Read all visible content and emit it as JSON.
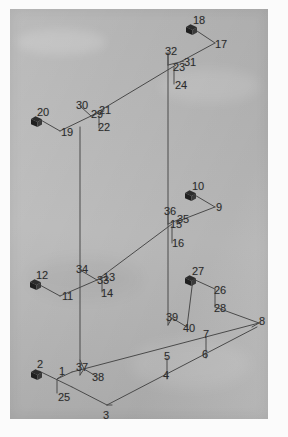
{
  "figure": {
    "type": "isometric-line-diagram",
    "panel": {
      "background_color": "#b8b8b8",
      "page_color": "#fbfbfb",
      "line_color": "#4a4a4a",
      "label_color": "#2b2b2b",
      "marker_color": "#2d2d2d",
      "x": 10,
      "y": 9,
      "width": 258,
      "height": 410
    }
  },
  "markers": [
    {
      "name": "node-marker-2",
      "label": "2",
      "x": 30,
      "y": 367,
      "label_x": 37,
      "label_y": 359
    },
    {
      "name": "node-marker-12",
      "label": "12",
      "x": 29,
      "y": 277,
      "label_x": 36,
      "label_y": 270
    },
    {
      "name": "node-marker-20",
      "label": "20",
      "x": 30,
      "y": 114,
      "label_x": 37,
      "label_y": 107
    },
    {
      "name": "node-marker-18",
      "label": "18",
      "x": 185,
      "y": 22,
      "label_x": 193,
      "label_y": 15
    },
    {
      "name": "node-marker-10",
      "label": "10",
      "x": 184,
      "y": 188,
      "label_x": 192,
      "label_y": 181
    },
    {
      "name": "node-marker-27",
      "label": "27",
      "x": 184,
      "y": 273,
      "label_x": 192,
      "label_y": 266
    }
  ],
  "labels": [
    {
      "id": "1",
      "text": "1",
      "x": 59,
      "y": 366
    },
    {
      "id": "2",
      "text": "2",
      "x": 37,
      "y": 359
    },
    {
      "id": "3",
      "text": "3",
      "x": 103,
      "y": 410
    },
    {
      "id": "4",
      "text": "4",
      "x": 163,
      "y": 370
    },
    {
      "id": "5",
      "text": "5",
      "x": 164,
      "y": 351
    },
    {
      "id": "6",
      "text": "6",
      "x": 202,
      "y": 349
    },
    {
      "id": "7",
      "text": "7",
      "x": 203,
      "y": 329
    },
    {
      "id": "8",
      "text": "8",
      "x": 259,
      "y": 316
    },
    {
      "id": "9",
      "text": "9",
      "x": 216,
      "y": 202
    },
    {
      "id": "10",
      "text": "10",
      "x": 192,
      "y": 181
    },
    {
      "id": "11",
      "text": "11",
      "x": 62,
      "y": 291
    },
    {
      "id": "12",
      "text": "12",
      "x": 36,
      "y": 270
    },
    {
      "id": "13",
      "text": "13",
      "x": 103,
      "y": 272
    },
    {
      "id": "14",
      "text": "14",
      "x": 101,
      "y": 288
    },
    {
      "id": "15",
      "text": "15",
      "x": 170,
      "y": 219
    },
    {
      "id": "16",
      "text": "16",
      "x": 172,
      "y": 238
    },
    {
      "id": "17",
      "text": "17",
      "x": 215,
      "y": 39
    },
    {
      "id": "18",
      "text": "18",
      "x": 193,
      "y": 15
    },
    {
      "id": "19",
      "text": "19",
      "x": 61,
      "y": 127
    },
    {
      "id": "20",
      "text": "20",
      "x": 37,
      "y": 107
    },
    {
      "id": "21",
      "text": "21",
      "x": 99,
      "y": 105
    },
    {
      "id": "22",
      "text": "22",
      "x": 98,
      "y": 122
    },
    {
      "id": "23",
      "text": "23",
      "x": 173,
      "y": 62
    },
    {
      "id": "24",
      "text": "24",
      "x": 175,
      "y": 80
    },
    {
      "id": "25",
      "text": "25",
      "x": 58,
      "y": 392
    },
    {
      "id": "26",
      "text": "26",
      "x": 214,
      "y": 285
    },
    {
      "id": "27",
      "text": "27",
      "x": 192,
      "y": 266
    },
    {
      "id": "28",
      "text": "28",
      "x": 214,
      "y": 303
    },
    {
      "id": "29",
      "text": "29",
      "x": 91,
      "y": 109
    },
    {
      "id": "30",
      "text": "30",
      "x": 76,
      "y": 100
    },
    {
      "id": "31",
      "text": "31",
      "x": 184,
      "y": 57
    },
    {
      "id": "32",
      "text": "32",
      "x": 165,
      "y": 46
    },
    {
      "id": "33",
      "text": "33",
      "x": 97,
      "y": 275
    },
    {
      "id": "34",
      "text": "34",
      "x": 76,
      "y": 264
    },
    {
      "id": "35",
      "text": "35",
      "x": 177,
      "y": 214
    },
    {
      "id": "36",
      "text": "36",
      "x": 164,
      "y": 206
    },
    {
      "id": "37",
      "text": "37",
      "x": 76,
      "y": 362
    },
    {
      "id": "38",
      "text": "38",
      "x": 92,
      "y": 372
    },
    {
      "id": "39",
      "text": "39",
      "x": 166,
      "y": 312
    },
    {
      "id": "40",
      "text": "40",
      "x": 183,
      "y": 323
    }
  ],
  "lines": [
    {
      "name": "member-25-leader",
      "points": "57,393 57,379 72,372"
    },
    {
      "name": "member-1-leader",
      "points": "63,375 57,379"
    },
    {
      "name": "marker2-to-node1",
      "points": "39,371 72,387"
    },
    {
      "name": "base-left-run",
      "points": "72,387 107,405"
    },
    {
      "name": "base-front-run",
      "points": "107,405 257,327"
    },
    {
      "name": "base-upper-run",
      "points": "72,372 259,323"
    },
    {
      "name": "member-3-leader",
      "points": "107,405 112,405"
    },
    {
      "name": "member-4-5-leader",
      "points": "167,379 167,358"
    },
    {
      "name": "member-6-7-leader",
      "points": "206,358 206,337"
    },
    {
      "name": "member-8-leader",
      "points": "259,323 252,327"
    },
    {
      "name": "col-left-lower",
      "points": "80,375 80,127"
    },
    {
      "name": "col-left-37",
      "points": "80,375 84,369"
    },
    {
      "name": "member-37-leader",
      "points": "84,369 80,360"
    },
    {
      "name": "member-38-leader",
      "points": "96,376 84,369"
    },
    {
      "name": "col-mid-lower",
      "points": "168,325 168,53"
    },
    {
      "name": "member-39-leader",
      "points": "168,325 172,318"
    },
    {
      "name": "member-40-leader",
      "points": "187,327 172,318"
    },
    {
      "name": "brace-11-to-33",
      "points": "60,296 97,280"
    },
    {
      "name": "marker12-to-11",
      "points": "38,284 60,296"
    },
    {
      "name": "member-34-leader",
      "points": "80,270 97,280"
    },
    {
      "name": "member-33-13",
      "points": "97,280 107,276"
    },
    {
      "name": "member-14-leader",
      "points": "102,280 102,292"
    },
    {
      "name": "diag-33-to-35",
      "points": "97,280 172,224"
    },
    {
      "name": "brace-15-35",
      "points": "168,224 180,219"
    },
    {
      "name": "member-36-leader",
      "points": "168,213 168,224"
    },
    {
      "name": "member-16-leader",
      "points": "172,226 172,243"
    },
    {
      "name": "marker10-to-9",
      "points": "193,194 215,207"
    },
    {
      "name": "member-9-to-35",
      "points": "215,207 176,222"
    },
    {
      "name": "brace-19-to-29",
      "points": "60,131 91,116"
    },
    {
      "name": "marker20-to-19",
      "points": "39,119 60,131"
    },
    {
      "name": "member-30-leader",
      "points": "80,106 91,116"
    },
    {
      "name": "member-29-21",
      "points": "91,116 104,111"
    },
    {
      "name": "member-22-leader",
      "points": "99,116 99,128"
    },
    {
      "name": "diag-29-to-23",
      "points": "91,116 176,65"
    },
    {
      "name": "brace-23-31",
      "points": "168,65 184,61"
    },
    {
      "name": "member-32-leader",
      "points": "168,53 168,65"
    },
    {
      "name": "member-24-leader",
      "points": "174,67 174,84"
    },
    {
      "name": "marker18-to-17",
      "points": "194,29 215,43"
    },
    {
      "name": "member-17-to-31",
      "points": "215,43 180,62"
    },
    {
      "name": "marker27-to-26",
      "points": "193,279 215,289"
    },
    {
      "name": "member-26-28",
      "points": "215,289 215,307"
    },
    {
      "name": "member-28-to-8",
      "points": "215,307 259,323"
    },
    {
      "name": "member-27-to-40",
      "points": "193,279 187,327"
    }
  ]
}
